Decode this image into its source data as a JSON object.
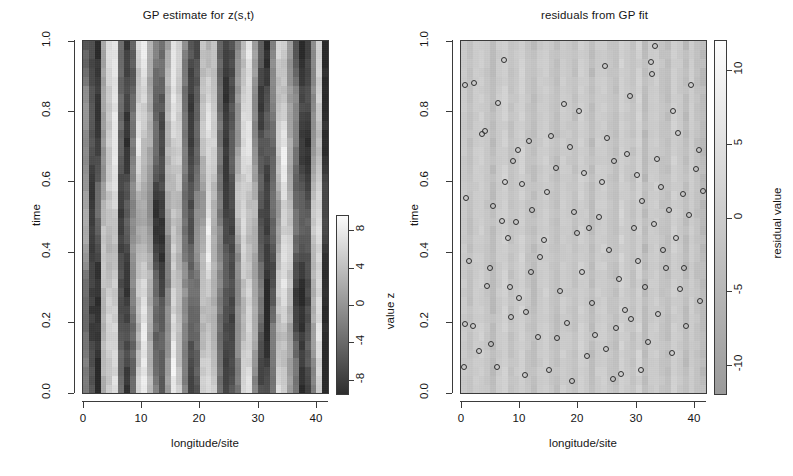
{
  "figure": {
    "width": 793,
    "height": 476,
    "background": "#ffffff",
    "foreground": "#161616"
  },
  "chart_data": [
    {
      "id": "gp-estimate",
      "type": "heatmap",
      "title": "GP estimate for z(s,t)",
      "xlabel": "longitude/site",
      "ylabel": "time",
      "xlim": [
        0,
        42
      ],
      "ylim": [
        0.0,
        1.0
      ],
      "xticks": [
        "0",
        "10",
        "20",
        "30",
        "40"
      ],
      "xtick_values": [
        0,
        10,
        20,
        30,
        40
      ],
      "yticks": [
        "0.0",
        "0.2",
        "0.4",
        "0.6",
        "0.8",
        "1.0"
      ],
      "ytick_values": [
        0.0,
        0.2,
        0.4,
        0.6,
        0.8,
        1.0
      ],
      "grid": false,
      "colormap": "grayscale",
      "colorbar": {
        "label": "value z",
        "ticks": [
          "8",
          "4",
          "0",
          "-4",
          "-8"
        ],
        "tick_values": [
          8,
          4,
          0,
          -4,
          -8
        ],
        "range": [
          -9.5,
          9.5
        ],
        "low_color": "#2e2e2e",
        "high_color": "#fbfbfb"
      },
      "n_sites": 42,
      "n_times": 40,
      "site_means": [
        -1.2,
        -6.8,
        -7.4,
        2.6,
        5.2,
        6.4,
        -5.4,
        -7.2,
        -2.1,
        4.8,
        5.6,
        2.2,
        -4.6,
        -6.2,
        1.4,
        6.1,
        4.4,
        -1.8,
        -5.8,
        -3.2,
        3.6,
        6.2,
        4.0,
        -2.4,
        -7.0,
        -6.0,
        0.8,
        5.4,
        6.0,
        1.2,
        -5.2,
        -7.6,
        -3.4,
        4.2,
        6.3,
        2.8,
        -4.0,
        -7.4,
        -6.6,
        1.8,
        5.8,
        -8.6
      ]
    },
    {
      "id": "gp-residuals",
      "type": "scatter",
      "title": "residuals from GP fit",
      "xlabel": "longitude/site",
      "ylabel": "time",
      "xlim": [
        0,
        42
      ],
      "ylim": [
        0.0,
        1.0
      ],
      "xticks": [
        "0",
        "10",
        "20",
        "30",
        "40"
      ],
      "xtick_values": [
        0,
        10,
        20,
        30,
        40
      ],
      "yticks": [
        "0.0",
        "0.2",
        "0.4",
        "0.6",
        "0.8",
        "1.0"
      ],
      "ytick_values": [
        0.0,
        0.2,
        0.4,
        0.6,
        0.8,
        1.0
      ],
      "grid": false,
      "marker": "open-circle",
      "marker_color": "#303030",
      "colorbar": {
        "label": "residual value",
        "ticks": [
          "10",
          "5",
          "0",
          "-5",
          "-10"
        ],
        "tick_values": [
          10,
          5,
          0,
          -5,
          -10
        ],
        "range": [
          -12,
          12
        ],
        "low_color": "#9a9a9a",
        "high_color": "#fdfdfd"
      },
      "background_site_means": [
        0.4,
        -1.6,
        0.9,
        1.4,
        -0.5,
        -2.6,
        0.7,
        1.8,
        -1.2,
        0.3,
        2.0,
        -0.8,
        -2.2,
        0.6,
        1.5,
        -0.4,
        -1.9,
        1.1,
        0.2,
        -1.4,
        1.7,
        0.5,
        -2.4,
        0.8,
        1.3,
        -0.7,
        -1.6,
        2.1,
        0.4,
        -1.1,
        1.9,
        -2.8,
        0.6,
        1.2,
        -0.9,
        -2.0,
        1.6,
        0.3,
        -2.5,
        1.0,
        -1.3,
        -3.0
      ],
      "points": [
        [
          0.6,
          0.875
        ],
        [
          2.2,
          0.88
        ],
        [
          0.9,
          0.555
        ],
        [
          1.3,
          0.375
        ],
        [
          0.6,
          0.195
        ],
        [
          2.1,
          0.19
        ],
        [
          0.5,
          0.075
        ],
        [
          4.1,
          0.745
        ],
        [
          7.6,
          0.6
        ],
        [
          7.4,
          0.945
        ],
        [
          5.4,
          0.53
        ],
        [
          3.6,
          0.735
        ],
        [
          6.4,
          0.825
        ],
        [
          8.9,
          0.66
        ],
        [
          9.5,
          0.485
        ],
        [
          4.9,
          0.355
        ],
        [
          4.5,
          0.305
        ],
        [
          5.2,
          0.14
        ],
        [
          3.0,
          0.12
        ],
        [
          6.2,
          0.075
        ],
        [
          10.4,
          0.595
        ],
        [
          9.8,
          0.69
        ],
        [
          11.6,
          0.715
        ],
        [
          8.0,
          0.44
        ],
        [
          7.0,
          0.49
        ],
        [
          12.2,
          0.52
        ],
        [
          10.0,
          0.27
        ],
        [
          11.2,
          0.23
        ],
        [
          8.6,
          0.215
        ],
        [
          12.0,
          0.345
        ],
        [
          14.2,
          0.435
        ],
        [
          13.5,
          0.385
        ],
        [
          15.4,
          0.73
        ],
        [
          16.2,
          0.64
        ],
        [
          14.8,
          0.57
        ],
        [
          17.0,
          0.29
        ],
        [
          16.4,
          0.155
        ],
        [
          18.1,
          0.2
        ],
        [
          19.4,
          0.515
        ],
        [
          20.2,
          0.8
        ],
        [
          18.6,
          0.7
        ],
        [
          21.0,
          0.625
        ],
        [
          19.8,
          0.455
        ],
        [
          20.8,
          0.345
        ],
        [
          22.4,
          0.255
        ],
        [
          21.6,
          0.105
        ],
        [
          23.0,
          0.165
        ],
        [
          19.1,
          0.035
        ],
        [
          24.2,
          0.6
        ],
        [
          23.6,
          0.5
        ],
        [
          25.0,
          0.725
        ],
        [
          24.6,
          0.93
        ],
        [
          26.2,
          0.66
        ],
        [
          25.4,
          0.405
        ],
        [
          27.0,
          0.325
        ],
        [
          26.6,
          0.185
        ],
        [
          28.1,
          0.235
        ],
        [
          24.9,
          0.125
        ],
        [
          29.0,
          0.845
        ],
        [
          28.4,
          0.68
        ],
        [
          30.2,
          0.62
        ],
        [
          29.6,
          0.47
        ],
        [
          31.0,
          0.545
        ],
        [
          30.4,
          0.375
        ],
        [
          31.6,
          0.3
        ],
        [
          29.2,
          0.21
        ],
        [
          32.1,
          0.145
        ],
        [
          33.2,
          0.985
        ],
        [
          32.6,
          0.94
        ],
        [
          32.8,
          0.905
        ],
        [
          33.6,
          0.665
        ],
        [
          34.2,
          0.585
        ],
        [
          33.0,
          0.48
        ],
        [
          34.6,
          0.405
        ],
        [
          35.2,
          0.355
        ],
        [
          33.8,
          0.225
        ],
        [
          35.6,
          0.52
        ],
        [
          36.4,
          0.8
        ],
        [
          37.2,
          0.74
        ],
        [
          36.8,
          0.44
        ],
        [
          38.0,
          0.565
        ],
        [
          37.6,
          0.295
        ],
        [
          38.6,
          0.19
        ],
        [
          39.4,
          0.875
        ],
        [
          40.2,
          0.635
        ],
        [
          39.0,
          0.505
        ],
        [
          40.8,
          0.69
        ],
        [
          41.4,
          0.575
        ],
        [
          38.2,
          0.355
        ],
        [
          41.0,
          0.26
        ],
        [
          36.2,
          0.115
        ],
        [
          30.8,
          0.065
        ],
        [
          27.4,
          0.055
        ],
        [
          15.0,
          0.065
        ],
        [
          11.0,
          0.05
        ],
        [
          22.0,
          0.47
        ],
        [
          17.6,
          0.82
        ],
        [
          13.2,
          0.16
        ],
        [
          8.4,
          0.3
        ],
        [
          26.0,
          0.04
        ]
      ]
    }
  ]
}
